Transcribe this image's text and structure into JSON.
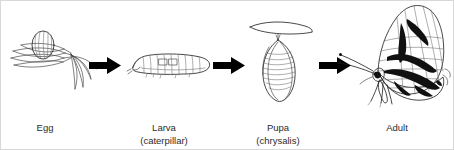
{
  "diagram": {
    "stages": [
      {
        "id": "egg",
        "label": "Egg",
        "sublabel": "",
        "illustration": "egg-on-leaves-icon",
        "label_x": 44,
        "label_y": 130
      },
      {
        "id": "larva",
        "label": "Larva",
        "sublabel": "(caterpillar)",
        "illustration": "caterpillar-icon",
        "label_x": 163,
        "label_y": 130
      },
      {
        "id": "pupa",
        "label": "Pupa",
        "sublabel": "(chrysalis)",
        "illustration": "chrysalis-icon",
        "label_x": 277,
        "label_y": 130
      },
      {
        "id": "adult",
        "label": "Adult",
        "sublabel": "",
        "illustration": "butterfly-icon",
        "label_x": 396,
        "label_y": 130
      }
    ],
    "arrows": [
      {
        "id": "arrow-egg-to-larva",
        "name": "arrow-right-icon"
      },
      {
        "id": "arrow-larva-to-pupa",
        "name": "arrow-right-icon"
      },
      {
        "id": "arrow-pupa-to-adult",
        "name": "arrow-right-icon"
      }
    ],
    "colors": {
      "background": "#ffffff",
      "ink": "#4a4a4a",
      "ink_dark": "#1a1a1a",
      "arrow": "#000000",
      "text": "#2b2b2b",
      "border": "#d8d8d8"
    }
  }
}
